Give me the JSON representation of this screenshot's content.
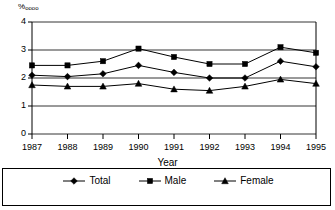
{
  "chart_data": {
    "type": "line",
    "title": "",
    "xlabel": "Year",
    "ylabel": "%oooo",
    "ylabel_numerator": "%",
    "ylabel_denominator": "oooo",
    "categories": [
      "1987",
      "1988",
      "1989",
      "1990",
      "1991",
      "1992",
      "1993",
      "1994",
      "1995"
    ],
    "x": [
      1987,
      1988,
      1989,
      1990,
      1991,
      1992,
      1993,
      1994,
      1995
    ],
    "ylim": [
      0,
      4
    ],
    "yticks": [
      "0",
      "1",
      "2",
      "3",
      "4"
    ],
    "ytick_values": [
      0,
      1,
      2,
      3,
      4
    ],
    "grid": true,
    "grid_axis": "y",
    "legend_position": "bottom",
    "series": [
      {
        "name": "Total",
        "marker": "diamond",
        "color": "#000000",
        "values": [
          2.1,
          2.05,
          2.15,
          2.45,
          2.2,
          2.0,
          2.0,
          2.6,
          2.4
        ]
      },
      {
        "name": "Male",
        "marker": "square",
        "color": "#000000",
        "values": [
          2.45,
          2.45,
          2.6,
          3.05,
          2.75,
          2.5,
          2.5,
          3.1,
          2.9
        ]
      },
      {
        "name": "Female",
        "marker": "triangle",
        "color": "#000000",
        "values": [
          1.75,
          1.7,
          1.7,
          1.8,
          1.6,
          1.55,
          1.7,
          1.95,
          1.8
        ]
      }
    ]
  },
  "legend": {
    "items": [
      {
        "label": "Total",
        "marker": "diamond"
      },
      {
        "label": "Male",
        "marker": "square"
      },
      {
        "label": "Female",
        "marker": "triangle"
      }
    ]
  },
  "axes": {
    "y_unit_label": "%oooo",
    "x_title": "Year"
  }
}
